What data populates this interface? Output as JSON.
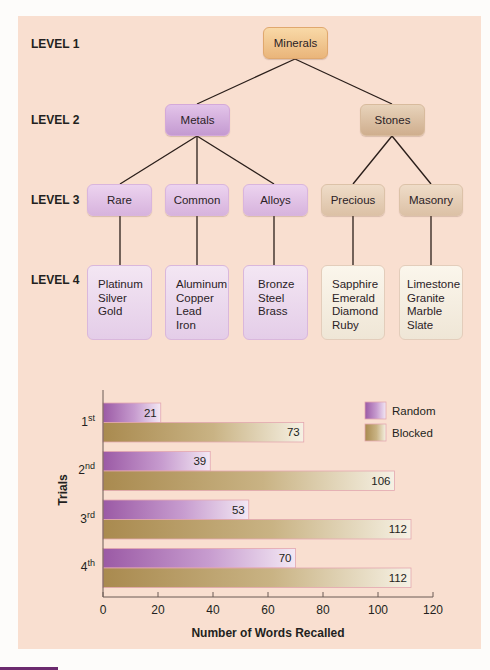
{
  "diagram": {
    "level_labels": [
      "LEVEL 1",
      "LEVEL 2",
      "LEVEL 3",
      "LEVEL 4"
    ],
    "root": "Minerals",
    "level2": [
      "Metals",
      "Stones"
    ],
    "level3": [
      "Rare",
      "Common",
      "Alloys",
      "Precious",
      "Masonry"
    ],
    "level4": [
      [
        "Platinum",
        "Silver",
        "Gold"
      ],
      [
        "Aluminum",
        "Copper",
        "Lead",
        "Iron"
      ],
      [
        "Bronze",
        "Steel",
        "Brass"
      ],
      [
        "Sapphire",
        "Emerald",
        "Diamond",
        "Ruby"
      ],
      [
        "Limestone",
        "Granite",
        "Marble",
        "Slate"
      ]
    ],
    "colors": {
      "root": "#eab57a",
      "metals": "#c49ad1",
      "stones": "#cfae8e",
      "background": "#f9dfd0"
    }
  },
  "chart_data": {
    "type": "bar",
    "orientation": "horizontal",
    "categories": [
      "1st",
      "2nd",
      "3rd",
      "4th"
    ],
    "category_parts": [
      [
        "1",
        "st"
      ],
      [
        "2",
        "nd"
      ],
      [
        "3",
        "rd"
      ],
      [
        "4",
        "th"
      ]
    ],
    "series": [
      {
        "name": "Random",
        "values": [
          21,
          39,
          53,
          70
        ],
        "color": "#9b5aa5"
      },
      {
        "name": "Blocked",
        "values": [
          73,
          106,
          112,
          112
        ],
        "color": "#a98a4f"
      }
    ],
    "xlabel": "Number of Words Recalled",
    "ylabel": "Trials",
    "xlim": [
      0,
      120
    ],
    "xticks": [
      0,
      20,
      40,
      60,
      80,
      100,
      120
    ],
    "legend": "top-right",
    "grid": false,
    "data_labels": true
  }
}
